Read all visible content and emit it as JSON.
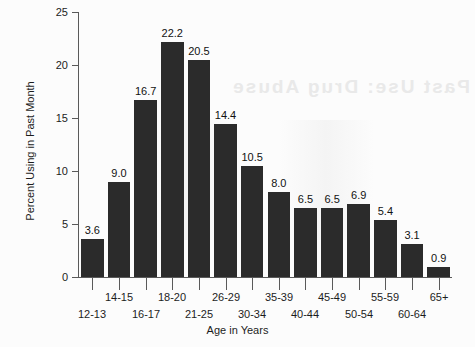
{
  "chart_data": {
    "type": "bar",
    "title": "",
    "xlabel": "Age in Years",
    "ylabel": "Percent Using in Past Month",
    "categories": [
      "12-13",
      "14-15",
      "16-17",
      "18-20",
      "21-25",
      "26-29",
      "30-34",
      "35-39",
      "40-44",
      "45-49",
      "50-54",
      "55-59",
      "60-64",
      "65+"
    ],
    "values": [
      3.6,
      9.0,
      16.7,
      22.2,
      20.5,
      14.4,
      10.5,
      8.0,
      6.5,
      6.5,
      6.9,
      5.4,
      3.1,
      0.9
    ],
    "value_labels": [
      "3.6",
      "9.0",
      "16.7",
      "22.2",
      "20.5",
      "14.4",
      "10.5",
      "8.0",
      "6.5",
      "6.5",
      "6.9",
      "5.4",
      "3.1",
      "0.9"
    ],
    "ylim": [
      0,
      25
    ],
    "yticks": [
      0,
      5,
      10,
      15,
      20,
      25
    ],
    "ytick_labels": [
      "0",
      "5",
      "10",
      "15",
      "20",
      "25"
    ],
    "grid": false,
    "legend": false,
    "bar_color": "#2b2b2b",
    "axis_color": "#5a5a5a",
    "background_color": "#fcfcfc",
    "label_stagger": [
      "low",
      "high",
      "low",
      "high",
      "low",
      "high",
      "low",
      "high",
      "low",
      "high",
      "low",
      "high",
      "low",
      "high"
    ]
  },
  "artifacts": {
    "bleed_through_text": "Past Use: Drug Abuse"
  }
}
